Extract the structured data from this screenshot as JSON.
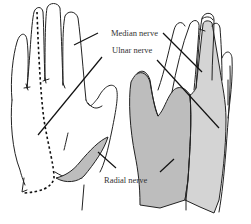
{
  "figure": {
    "labels": {
      "median": "Median nerve",
      "ulnar": "Ulnar nerve",
      "radial": "Radial nerve"
    },
    "colors": {
      "outline": "#222222",
      "median_shade": "#d4d4d4",
      "radial_shade": "#bdbdbd",
      "background": "#ffffff",
      "label_text": "#333333"
    },
    "views": [
      {
        "name": "left-hand",
        "regions": [
          "ulnar (dashed boundary)",
          "median",
          "radial (thumb web, shaded)"
        ]
      },
      {
        "name": "right-hand",
        "regions": [
          "radial (dark shade)",
          "median (light shade)",
          "ulnar (unshaded)"
        ]
      }
    ]
  }
}
